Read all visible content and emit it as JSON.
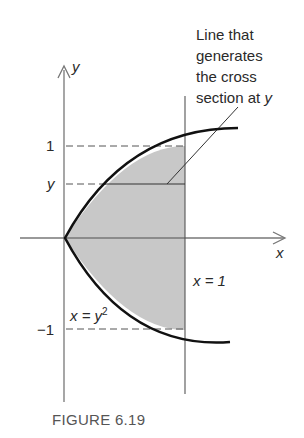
{
  "annotation": {
    "line1": "Line that",
    "line2": "generates",
    "line3": "the cross",
    "line4_prefix": "section at ",
    "line4_var": "y"
  },
  "axes": {
    "x_label": "x",
    "y_label": "y"
  },
  "ticks": {
    "one": "1",
    "y": "y",
    "neg_one": "−1"
  },
  "curve_label": {
    "lhs": "x = y",
    "exp": "2"
  },
  "line_label": "x = 1",
  "caption": "FIGURE 6.19",
  "colors": {
    "shade": "#c8c8c8",
    "curve": "#111111",
    "axis": "#777777"
  }
}
